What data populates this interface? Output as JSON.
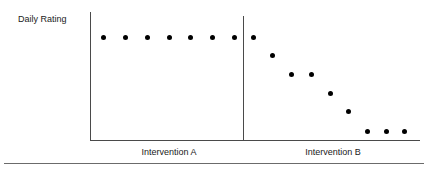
{
  "chart_data": {
    "type": "scatter",
    "title": "",
    "subtitle": "",
    "xlabel": "",
    "ylabel": "Daily Rating",
    "grid": false,
    "legend": null,
    "xlim": [
      0,
      16
    ],
    "ylim": [
      0,
      10
    ],
    "axis_ticks": {
      "x": [],
      "y": []
    },
    "phase_line": {
      "label": "",
      "after_session": 7
    },
    "annotations": [
      {
        "text": "Intervention A",
        "position": "below-axis-left"
      },
      {
        "text": "Intervention B",
        "position": "below-axis-right"
      }
    ],
    "series": [
      {
        "name": "Intervention A",
        "phase": "A",
        "x": [
          1,
          2,
          3,
          4,
          5,
          6,
          7
        ],
        "values": [
          9,
          9,
          9,
          9,
          9,
          9,
          9
        ],
        "points_px": [
          {
            "x": 103,
            "y": 37
          },
          {
            "x": 125,
            "y": 37
          },
          {
            "x": 147,
            "y": 37
          },
          {
            "x": 169,
            "y": 37
          },
          {
            "x": 190,
            "y": 37
          },
          {
            "x": 212,
            "y": 37
          },
          {
            "x": 234,
            "y": 37
          }
        ]
      },
      {
        "name": "Intervention B",
        "phase": "B",
        "x": [
          8,
          9,
          10,
          11,
          12,
          13,
          14,
          15,
          16
        ],
        "values": [
          9,
          7.6,
          6.2,
          6.2,
          4.7,
          3.3,
          1.8,
          1.8,
          1.8
        ],
        "points_px": [
          {
            "x": 253,
            "y": 37
          },
          {
            "x": 272,
            "y": 55
          },
          {
            "x": 291,
            "y": 74
          },
          {
            "x": 311,
            "y": 74
          },
          {
            "x": 330,
            "y": 93
          },
          {
            "x": 348,
            "y": 111
          },
          {
            "x": 367,
            "y": 131
          },
          {
            "x": 386,
            "y": 131
          },
          {
            "x": 404,
            "y": 131
          }
        ]
      }
    ]
  },
  "labels": {
    "y_axis": "Daily Rating",
    "phase_a": "Intervention A",
    "phase_b": "Intervention B"
  },
  "colors": {
    "marker": "#000000",
    "axis": "#4a4a4a",
    "rule": "#6b6b6b",
    "text": "#1a1a1a",
    "background": "#ffffff"
  },
  "geometry": {
    "axis_x_left": 90,
    "axis_x_right": 420,
    "axis_baseline_y": 140,
    "axis_y_top": 12,
    "phase_line_x": 243,
    "footer_rule_y": 163,
    "marker_diameter": 5
  }
}
